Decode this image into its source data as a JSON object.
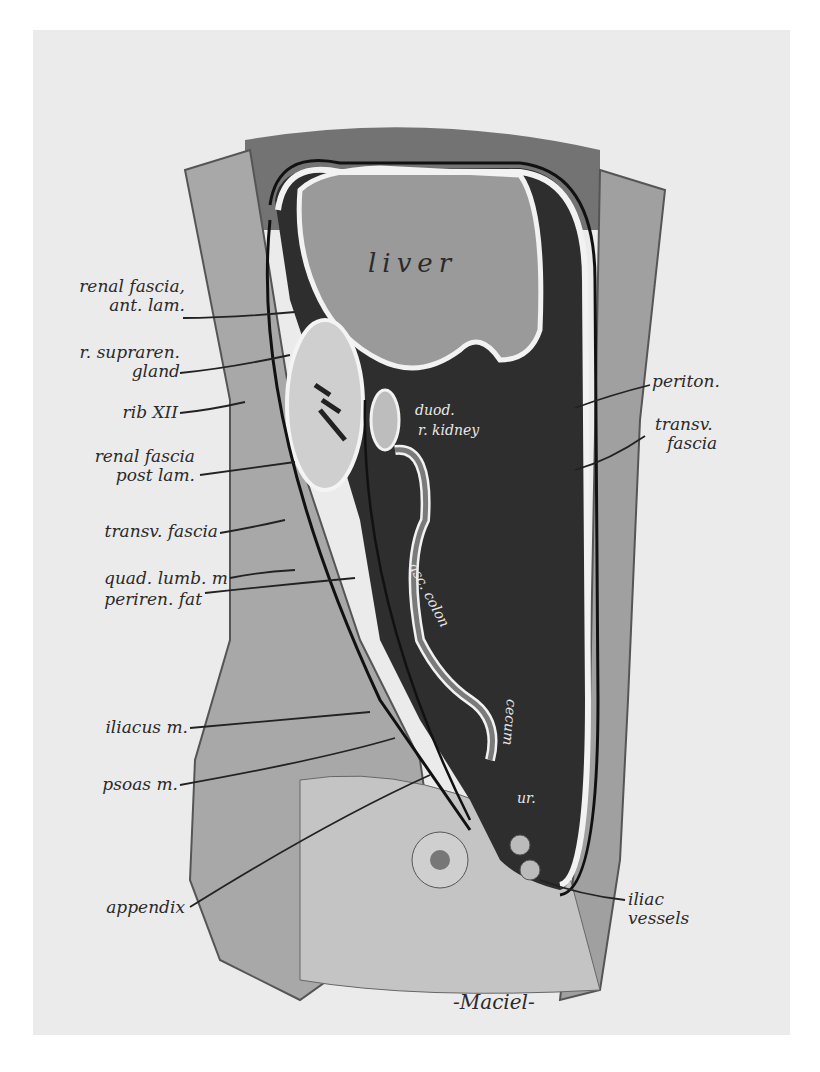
{
  "figure": {
    "type": "anatomical sagittal section illustration",
    "signature": "-Maciel-",
    "colors": {
      "background": "#ebebeb",
      "cavity": "#2e2e2e",
      "liver": "#9a9a9a",
      "membrane": "#f2f2f2",
      "text": "#2a2a2a"
    }
  },
  "labels_left": [
    {
      "line1": "renal fascia,",
      "line2": "ant. lam."
    },
    {
      "line1": "r. supraren.",
      "line2": "gland"
    },
    {
      "line1": "rib XII",
      "line2": ""
    },
    {
      "line1": "renal fascia",
      "line2": "post lam."
    },
    {
      "line1": "transv. fascia",
      "line2": ""
    },
    {
      "line1": "quad. lumb. m",
      "line2": ""
    },
    {
      "line1": "periren. fat",
      "line2": ""
    },
    {
      "line1": "iliacus m.",
      "line2": ""
    },
    {
      "line1": "psoas m.",
      "line2": ""
    },
    {
      "line1": "appendix",
      "line2": ""
    }
  ],
  "labels_right": [
    {
      "line1": "periton.",
      "line2": ""
    },
    {
      "line1": "transv.",
      "line2": "fascia"
    },
    {
      "line1": "iliac",
      "line2": "vessels"
    }
  ],
  "labels_inside": {
    "liver": "liver",
    "duodenum": "duod.",
    "kidney": "r. kidney",
    "asc_colon": "asc. colon",
    "cecum": "cecum",
    "ureter": "ur."
  }
}
